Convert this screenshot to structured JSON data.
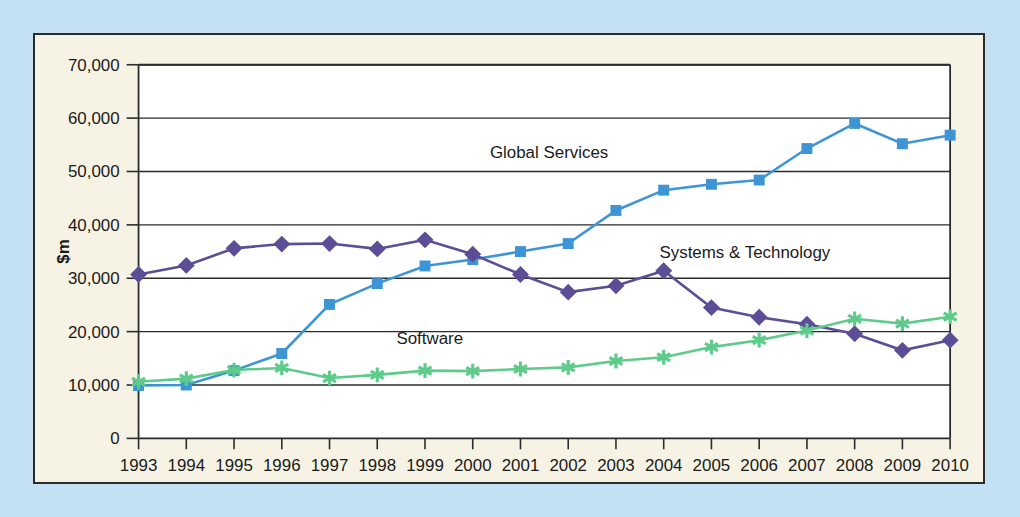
{
  "figure": {
    "outer_background": "#c3e1f2",
    "panel_background": "#f6f3e4",
    "plot_background": "#ffffff",
    "frame_color": "#2b2b2b"
  },
  "chart_data": {
    "type": "line",
    "title": "",
    "xlabel": "",
    "ylabel": "$m",
    "x": [
      1993,
      1994,
      1995,
      1996,
      1997,
      1998,
      1999,
      2000,
      2001,
      2002,
      2003,
      2004,
      2005,
      2006,
      2007,
      2008,
      2009,
      2010
    ],
    "categories": [
      "1993",
      "1994",
      "1995",
      "1996",
      "1997",
      "1998",
      "1999",
      "2000",
      "2001",
      "2002",
      "2003",
      "2004",
      "2005",
      "2006",
      "2007",
      "2008",
      "2009",
      "2010"
    ],
    "xlim": [
      1993,
      2010
    ],
    "ylim": [
      0,
      70000
    ],
    "ytick_values": [
      0,
      10000,
      20000,
      30000,
      40000,
      50000,
      60000,
      70000
    ],
    "ytick_labels": [
      "0",
      "10,000",
      "20,000",
      "30,000",
      "40,000",
      "50,000",
      "60,000",
      "70,000"
    ],
    "grid": true,
    "legend": "inline-annotations",
    "series": [
      {
        "name": "Global Services",
        "color": "#3d95d6",
        "marker": "square",
        "label_x": 2001.6,
        "label_y": 52600,
        "values": [
          9900,
          10000,
          12700,
          15900,
          25100,
          29000,
          32300,
          33500,
          35000,
          36500,
          42700,
          46500,
          47600,
          48400,
          54300,
          59000,
          55200,
          56800
        ]
      },
      {
        "name": "Systems & Technology",
        "color": "#5c4e96",
        "marker": "diamond",
        "label_x": 2005.7,
        "label_y": 33700,
        "values": [
          30700,
          32400,
          35600,
          36400,
          36500,
          35500,
          37200,
          34500,
          30700,
          27400,
          28600,
          31400,
          24500,
          22700,
          21400,
          19600,
          16500,
          18400
        ]
      },
      {
        "name": "Software",
        "color": "#5ecb8b",
        "marker": "star",
        "label_x": 1999.1,
        "label_y": 17600,
        "values": [
          10600,
          11200,
          12800,
          13200,
          11300,
          11900,
          12700,
          12600,
          13000,
          13300,
          14500,
          15200,
          17100,
          18400,
          20200,
          22400,
          21500,
          22800
        ]
      }
    ]
  }
}
